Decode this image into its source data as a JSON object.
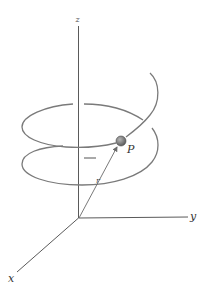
{
  "figure": {
    "type": "helix-position-vector",
    "axes": {
      "z_label": "z",
      "y_label": "y",
      "x_label": "x"
    },
    "particle": {
      "label": "P",
      "color": "#7d7d7d"
    },
    "position_vector": {
      "label": "r"
    }
  }
}
